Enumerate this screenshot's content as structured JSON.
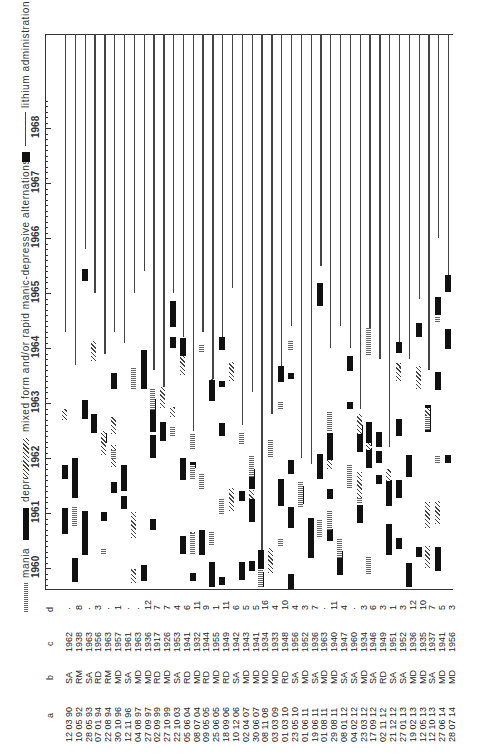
{
  "legend": {
    "mania": "mania",
    "depression": "depression",
    "mixed": "mixed form and/or rapid manic-depressive alternations",
    "lithium": "lithium administration"
  },
  "columns": {
    "a": "a",
    "b": "b",
    "c": "c",
    "d": "d"
  },
  "years": [
    "1960",
    "1961",
    "1962",
    "1963",
    "1964",
    "1965",
    "1966",
    "1967",
    "1968"
  ],
  "chart_data": {
    "type": "timeline",
    "title": "",
    "orientation": "rotated 90 degrees; time axis vertical (1960 bottom to 1968 top), one column per patient",
    "legend": [
      "mania",
      "depression",
      "mixed form and/or rapid manic-depressive alternations",
      "lithium administration"
    ],
    "y_axis_years": [
      1960,
      1961,
      1962,
      1963,
      1964,
      1965,
      1966,
      1967,
      1968
    ],
    "table_columns": [
      "a (birth date)",
      "b (diagnosis)",
      "c (onset year)",
      "d"
    ],
    "patients": [
      {
        "a": "12 03 90",
        "b": "SA",
        "c": "1962",
        "d": "·",
        "lithium_start": 1964.3
      },
      {
        "a": "10 05 92",
        "b": "RM",
        "c": "1938",
        "d": "8",
        "lithium_start": 1963.7
      },
      {
        "a": "28 05 93",
        "b": "SA",
        "c": "1963",
        "d": "·",
        "lithium_start": 1965.8
      },
      {
        "a": "07 01 94",
        "b": "RD",
        "c": "1956",
        "d": "3",
        "lithium_start": 1965.0
      },
      {
        "a": "22 08 94",
        "b": "RM",
        "c": "1963",
        "d": "·",
        "lithium_start": 1963.9
      },
      {
        "a": "30 10 96",
        "b": "MD",
        "c": "1957",
        "d": "1",
        "lithium_start": 1964.3
      },
      {
        "a": "12 11 96",
        "b": "SA",
        "c": "1961",
        "d": "·",
        "lithium_start": 1964.1
      },
      {
        "a": "04 08 97",
        "b": "MD",
        "c": "1963",
        "d": "·",
        "lithium_start": 1965.0
      },
      {
        "a": "27 09 97",
        "b": "MD",
        "c": "1936",
        "d": "12",
        "lithium_start": 1965.4
      },
      {
        "a": "02 09 99",
        "b": "RD",
        "c": "1917",
        "d": "7",
        "lithium_start": 1963.6
      },
      {
        "a": "27 10 99",
        "b": "MD",
        "c": "1926",
        "d": "7",
        "lithium_start": 1963.3
      },
      {
        "a": "22 10 03",
        "b": "SA",
        "c": "1953",
        "d": "4",
        "lithium_start": 1965.0
      },
      {
        "a": "05 06 04",
        "b": "RD",
        "c": "1941",
        "d": "6",
        "lithium_start": 1964.2
      },
      {
        "a": "08 07 04",
        "b": "MD",
        "c": "1932",
        "d": "11",
        "lithium_start": 1962.5
      },
      {
        "a": "09 05 05",
        "b": "RD",
        "c": "1944",
        "d": "9",
        "lithium_start": 1964.3
      },
      {
        "a": "25 06 05",
        "b": "MD",
        "c": "1955",
        "d": "1",
        "lithium_start": 1963.2
      },
      {
        "a": "18 09 06",
        "b": "RD",
        "c": "1949",
        "d": "11",
        "lithium_start": 1964.0
      },
      {
        "a": "10 12 06",
        "b": "SA",
        "c": "1942",
        "d": "6",
        "lithium_start": 1965.1
      },
      {
        "a": "02 04 07",
        "b": "MD",
        "c": "1943",
        "d": "5",
        "lithium_start": 1962.6
      },
      {
        "a": "30 06 07",
        "b": "MD",
        "c": "1941",
        "d": "5",
        "lithium_start": 1963.2
      },
      {
        "a": "08 11 08",
        "b": "MD",
        "c": "1934",
        "d": "16",
        "lithium_start": 1960.0
      },
      {
        "a": "03 03 09",
        "b": "MD",
        "c": "1933",
        "d": "4",
        "lithium_start": 1962.8
      },
      {
        "a": "01 03 10",
        "b": "RD",
        "c": "1948",
        "d": "10",
        "lithium_start": 1963.6
      },
      {
        "a": "23 05 10",
        "b": "SA",
        "c": "1956",
        "d": "4",
        "lithium_start": 1964.4
      },
      {
        "a": "01 06 11",
        "b": "MD",
        "c": "1952",
        "d": "3",
        "lithium_start": 1962.0
      },
      {
        "a": "19 06 11",
        "b": "SA",
        "c": "1936",
        "d": "7",
        "lithium_start": 1961.9
      },
      {
        "a": "01 08 11",
        "b": "MD",
        "c": "1963",
        "d": "·",
        "lithium_start": 1965.5
      },
      {
        "a": "29 08 11",
        "b": "MD",
        "c": "1940",
        "d": "11",
        "lithium_start": 1964.0
      },
      {
        "a": "08 01 12",
        "b": "SA",
        "c": "1947",
        "d": "4",
        "lithium_start": 1964.4
      },
      {
        "a": "04 02 12",
        "b": "SA",
        "c": "1960",
        "d": "·",
        "lithium_start": 1964.0
      },
      {
        "a": "23 03 12",
        "b": "MD",
        "c": "1934",
        "d": "3",
        "lithium_start": 1962.9
      },
      {
        "a": "17 09 12",
        "b": "SA",
        "c": "1946",
        "d": "6",
        "lithium_start": 1963.9
      },
      {
        "a": "02 11 12",
        "b": "RD",
        "c": "1949",
        "d": "3",
        "lithium_start": 1963.8
      },
      {
        "a": "21 12 12",
        "b": "SA",
        "c": "1951",
        "d": "1",
        "lithium_start": 1962.2
      },
      {
        "a": "27 01 13",
        "b": "SA",
        "c": "1952",
        "d": "3",
        "lithium_start": 1964.1
      },
      {
        "a": "19 02 13",
        "b": "MD",
        "c": "1936",
        "d": "12",
        "lithium_start": 1963.8
      },
      {
        "a": "12 05 13",
        "b": "MD",
        "c": "1935",
        "d": "10",
        "lithium_start": 1964.9
      },
      {
        "a": "12 10 13",
        "b": "SA",
        "c": "1937",
        "d": "7",
        "lithium_start": 1963.6
      },
      {
        "a": "27 06 14",
        "b": "MD",
        "c": "1941",
        "d": "5",
        "lithium_start": 1966.0
      },
      {
        "a": "28 07 14",
        "b": "MD",
        "c": "1956",
        "d": "3",
        "lithium_start": 1965.1
      }
    ]
  }
}
